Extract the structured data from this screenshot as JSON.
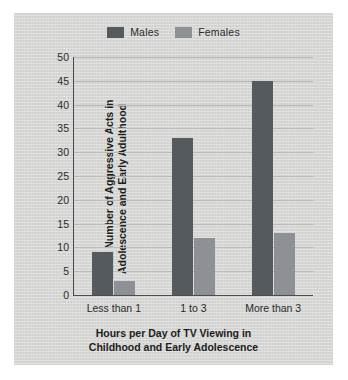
{
  "chart_data": {
    "type": "bar",
    "title": "",
    "categories": [
      "Less than 1",
      "1 to 3",
      "More than 3"
    ],
    "series": [
      {
        "name": "Males",
        "color": "#555a5e",
        "values": [
          9,
          33,
          45
        ]
      },
      {
        "name": "Females",
        "color": "#8d9195",
        "values": [
          3,
          12,
          13
        ]
      }
    ],
    "xlabel_line1": "Hours per Day of TV Viewing in",
    "xlabel_line2": "Childhood and Early Adolescence",
    "ylabel_line1": "Mean Number of Aggressive Acts in",
    "ylabel_line2": "Adolescence and Early Adulthood",
    "ylim": [
      0,
      50
    ],
    "yticks": [
      0,
      5,
      10,
      15,
      20,
      25,
      30,
      35,
      40,
      45,
      50
    ],
    "grid": true,
    "legend_position": "top-center"
  },
  "colors": {
    "panel": "#d6d6d4",
    "axis": "#4a4a4a",
    "gridline": "#b9b9b7",
    "text": "#1d1d1d"
  }
}
